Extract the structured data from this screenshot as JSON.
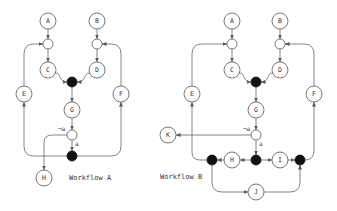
{
  "workflows": [
    {
      "title": "Workflow A",
      "nodes": {
        "A": {
          "label": "A",
          "type": "task"
        },
        "B": {
          "label": "B",
          "type": "task"
        },
        "C": {
          "label": "C",
          "type": "task"
        },
        "D": {
          "label": "D",
          "type": "task"
        },
        "E": {
          "label": "E",
          "type": "task"
        },
        "F": {
          "label": "F",
          "type": "task"
        },
        "G": {
          "label": "G",
          "type": "task"
        },
        "H": {
          "label": "H",
          "type": "task"
        }
      },
      "edge_labels": {
        "not_a": "¬a",
        "a": "a"
      }
    },
    {
      "title": "Workflow B",
      "nodes": {
        "A": {
          "label": "A",
          "type": "task"
        },
        "B": {
          "label": "B",
          "type": "task"
        },
        "C": {
          "label": "C",
          "type": "task"
        },
        "D": {
          "label": "D",
          "type": "task"
        },
        "E": {
          "label": "E",
          "type": "task"
        },
        "F": {
          "label": "F",
          "type": "task"
        },
        "G": {
          "label": "G",
          "type": "task"
        },
        "H": {
          "label": "H",
          "type": "task"
        },
        "I": {
          "label": "I",
          "type": "task"
        },
        "J": {
          "label": "J",
          "type": "task"
        },
        "K": {
          "label": "K",
          "type": "task"
        }
      },
      "edge_labels": {
        "not_a": "¬a",
        "a": "a"
      }
    }
  ],
  "legend": {
    "task": "white circle with letter",
    "xor_gateway": "small white circle",
    "and_gateway": "black filled circle"
  }
}
